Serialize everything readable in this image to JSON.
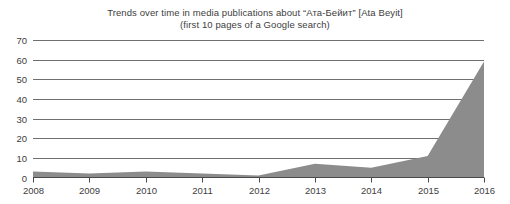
{
  "chart_data": {
    "type": "area",
    "title": "Trends over time in media publications about “Ата-Бейит” [Ata Beyit]",
    "subtitle": "(first 10 pages of a Google search)",
    "xlabel": "",
    "ylabel": "",
    "x": [
      2008,
      2009,
      2010,
      2011,
      2012,
      2013,
      2014,
      2015,
      2016
    ],
    "categories": [
      "2008",
      "2009",
      "2010",
      "2011",
      "2012",
      "2013",
      "2014",
      "2015",
      "2016"
    ],
    "values": [
      3,
      2,
      3,
      2,
      1,
      7,
      5,
      11,
      59
    ],
    "series": [
      {
        "name": "Publications",
        "values": [
          3,
          2,
          3,
          2,
          1,
          7,
          5,
          11,
          59
        ]
      }
    ],
    "ylim": [
      0,
      70
    ],
    "yticks": [
      0,
      10,
      20,
      30,
      40,
      50,
      60,
      70
    ],
    "ytick_labels": [
      "0",
      "10",
      "20",
      "30",
      "40",
      "50",
      "60",
      "70"
    ],
    "xlim": [
      2008,
      2016
    ],
    "xticks": [
      2008,
      2009,
      2010,
      2011,
      2012,
      2013,
      2014,
      2015,
      2016
    ],
    "xtick_labels": [
      "2008",
      "2009",
      "2010",
      "2011",
      "2012",
      "2013",
      "2014",
      "2015",
      "2016"
    ],
    "grid": true,
    "legend": false,
    "legend_position": "none",
    "colors": {
      "area_fill": "#8c8c8c",
      "gridline": "#6f6f6f",
      "axis": "#4a4a4a",
      "text": "#404040",
      "background": "#ffffff"
    }
  }
}
